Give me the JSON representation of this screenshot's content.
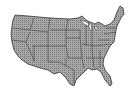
{
  "map": {
    "subject": "United States (contiguous) with state borders",
    "fill_color": "#9a9a9a",
    "border_color": "#333333",
    "background_color": "#ffffff"
  }
}
